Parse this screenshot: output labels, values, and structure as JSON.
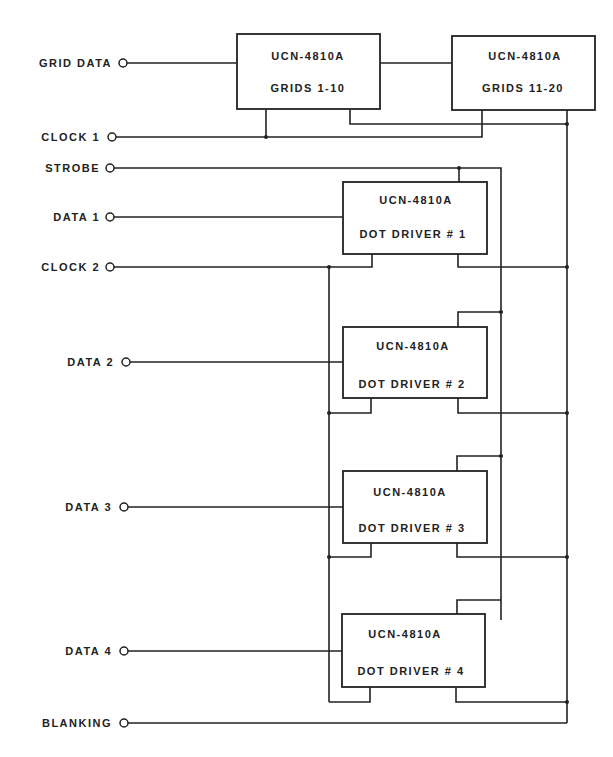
{
  "diagram": {
    "type": "schematic",
    "inputs": [
      {
        "id": "grid_data",
        "label": "GRID DATA",
        "y": 63
      },
      {
        "id": "clock1",
        "label": "CLOCK 1",
        "y": 137
      },
      {
        "id": "strobe",
        "label": "STROBE",
        "y": 168
      },
      {
        "id": "data1",
        "label": "DATA 1",
        "y": 217
      },
      {
        "id": "clock2",
        "label": "CLOCK 2",
        "y": 267
      },
      {
        "id": "data2",
        "label": "DATA 2",
        "y": 362
      },
      {
        "id": "data3",
        "label": "DATA 3",
        "y": 507
      },
      {
        "id": "data4",
        "label": "DATA 4",
        "y": 651
      },
      {
        "id": "blanking",
        "label": "BLANKING",
        "y": 723
      }
    ],
    "chips": [
      {
        "id": "grid1",
        "part": "UCN-4810A",
        "function": "GRIDS 1-10"
      },
      {
        "id": "grid2",
        "part": "UCN-4810A",
        "function": "GRIDS  11-20"
      },
      {
        "id": "dot1",
        "part": "UCN-4810A",
        "function": "DOT DRIVER # 1"
      },
      {
        "id": "dot2",
        "part": "UCN-4810A",
        "function": "DOT DRIVER # 2"
      },
      {
        "id": "dot3",
        "part": "UCN-4810A",
        "function": "DOT DRIVER # 3"
      },
      {
        "id": "dot4",
        "part": "UCN-4810A",
        "function": "DOT DRIVER # 4"
      }
    ]
  }
}
